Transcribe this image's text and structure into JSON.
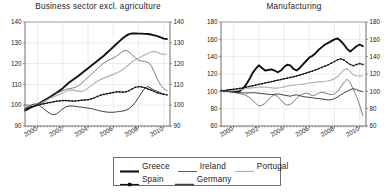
{
  "figure": {
    "panels": [
      {
        "title": "Business sector excl. agriculture"
      },
      {
        "title": "Manufacturing"
      }
    ]
  },
  "legend": {
    "rows": [
      [
        {
          "label": "Greece",
          "swatch": "solid-thick-line-swatch"
        },
        {
          "label": "Ireland",
          "swatch": "solid-thin-line-swatch"
        },
        {
          "label": "Portugal",
          "swatch": "solid-light-line-swatch"
        }
      ],
      [
        {
          "label": "Spain",
          "swatch": "marked-line-swatch"
        },
        {
          "label": "Germany",
          "swatch": "solid-medium-line-swatch"
        }
      ]
    ]
  },
  "colors": {
    "greece": "#111111",
    "ireland": "#5c5c5c",
    "portugal": "#b4b4b4",
    "spain": "#111111",
    "germany": "#3f3f3f",
    "axis": "#6e6e6e",
    "grid": "#d8d8d8",
    "background": "#ffffff"
  },
  "chart_data": [
    {
      "type": "line",
      "title": "Business sector excl. agriculture",
      "xlabel": "",
      "ylabel": "",
      "xlim": [
        1999.0,
        2010.5
      ],
      "ylim": [
        90,
        140
      ],
      "grid": true,
      "legend_position": "below-figure",
      "xticks": [
        2000,
        2002,
        2004,
        2006,
        2008,
        2010
      ],
      "xtick_labels": [
        "2000",
        "2002",
        "2004",
        "2006",
        "2008",
        "2010"
      ],
      "yticks": [
        90,
        100,
        110,
        120,
        130,
        140
      ],
      "ytick_labels": [
        "90",
        "100",
        "110",
        "120",
        "130",
        "140"
      ],
      "y_axis_mirrored": true,
      "x": [
        1999.0,
        1999.25,
        1999.5,
        1999.75,
        2000.0,
        2000.25,
        2000.5,
        2000.75,
        2001.0,
        2001.25,
        2001.5,
        2001.75,
        2002.0,
        2002.25,
        2002.5,
        2002.75,
        2003.0,
        2003.25,
        2003.5,
        2003.75,
        2004.0,
        2004.25,
        2004.5,
        2004.75,
        2005.0,
        2005.25,
        2005.5,
        2005.75,
        2006.0,
        2006.25,
        2006.5,
        2006.75,
        2007.0,
        2007.25,
        2007.5,
        2007.75,
        2008.0,
        2008.25,
        2008.5,
        2008.75,
        2009.0,
        2009.25,
        2009.5,
        2009.75,
        2010.0,
        2010.25
      ],
      "series": [
        {
          "name": "Greece",
          "values": [
            97.4,
            98.2,
            99.0,
            99.7,
            100.4,
            101.3,
            102.2,
            103.1,
            104.0,
            105.0,
            106.0,
            107.0,
            108.2,
            109.6,
            110.9,
            112.0,
            113.1,
            114.2,
            115.4,
            116.6,
            117.8,
            119.0,
            120.2,
            121.4,
            122.6,
            123.8,
            125.2,
            126.6,
            128.0,
            129.4,
            130.8,
            132.2,
            133.3,
            134.2,
            134.5,
            134.5,
            134.4,
            134.4,
            134.3,
            134.2,
            134.0,
            133.6,
            133.2,
            132.6,
            132.0,
            131.8
          ]
        },
        {
          "name": "Ireland",
          "values": [
            100.2,
            100.0,
            99.8,
            99.6,
            99.8,
            100.3,
            101.2,
            102.4,
            103.6,
            104.6,
            105.6,
            106.4,
            107.0,
            107.6,
            107.9,
            108.2,
            108.6,
            109.4,
            110.6,
            112.0,
            113.4,
            114.8,
            116.2,
            117.6,
            119.0,
            120.2,
            121.2,
            122.0,
            122.6,
            123.6,
            124.8,
            125.8,
            126.4,
            125.6,
            124.2,
            122.8,
            121.6,
            121.2,
            121.0,
            120.6,
            119.2,
            116.0,
            112.4,
            109.8,
            108.0,
            107.0
          ]
        },
        {
          "name": "Portugal",
          "values": [
            100.0,
            99.9,
            99.8,
            99.9,
            100.2,
            100.8,
            101.6,
            102.5,
            103.3,
            104.0,
            104.6,
            105.2,
            105.9,
            106.6,
            107.2,
            107.4,
            107.0,
            106.6,
            106.6,
            107.2,
            108.2,
            109.4,
            110.6,
            111.6,
            112.4,
            113.0,
            113.6,
            114.2,
            114.8,
            115.4,
            116.2,
            117.2,
            118.4,
            119.6,
            120.8,
            121.8,
            122.6,
            123.4,
            124.2,
            125.0,
            125.6,
            125.8,
            125.4,
            124.8,
            124.4,
            124.6
          ]
        },
        {
          "name": "Spain",
          "values": [
            98.0,
            98.6,
            99.2,
            99.6,
            100.0,
            100.4,
            100.7,
            101.0,
            101.3,
            101.6,
            101.9,
            102.1,
            102.2,
            102.2,
            102.1,
            102.0,
            102.0,
            102.2,
            102.4,
            102.5,
            102.6,
            103.0,
            103.6,
            104.2,
            104.8,
            105.2,
            105.5,
            105.8,
            106.1,
            106.4,
            106.4,
            106.3,
            106.4,
            107.0,
            107.8,
            108.6,
            108.9,
            108.8,
            108.4,
            107.8,
            107.2,
            106.6,
            106.0,
            105.6,
            105.2,
            105.0
          ]
        },
        {
          "name": "Germany",
          "values": [
            98.6,
            99.4,
            100.1,
            100.6,
            100.4,
            99.4,
            98.2,
            97.0,
            96.0,
            95.4,
            95.8,
            97.0,
            98.3,
            99.2,
            99.6,
            99.6,
            99.4,
            99.2,
            99.0,
            98.8,
            98.6,
            98.4,
            98.0,
            97.6,
            97.2,
            96.9,
            96.7,
            96.6,
            96.6,
            96.8,
            97.0,
            97.2,
            97.6,
            98.4,
            99.6,
            101.4,
            103.6,
            106.0,
            108.2,
            109.0,
            108.0,
            107.2,
            106.6,
            106.0,
            105.4,
            105.0
          ]
        }
      ]
    },
    {
      "type": "line",
      "title": "Manufacturing",
      "xlabel": "",
      "ylabel": "",
      "xlim": [
        1999.0,
        2010.5
      ],
      "ylim": [
        60,
        180
      ],
      "grid": true,
      "legend_position": "below-figure",
      "xticks": [
        2000,
        2002,
        2004,
        2006,
        2008,
        2010
      ],
      "xtick_labels": [
        "2000",
        "2002",
        "2004",
        "2006",
        "2008",
        "2010"
      ],
      "yticks": [
        60,
        80,
        100,
        120,
        140,
        160,
        180
      ],
      "ytick_labels": [
        "60",
        "80",
        "100",
        "120",
        "140",
        "160",
        "180"
      ],
      "y_axis_mirrored": true,
      "x": [
        1999.0,
        1999.25,
        1999.5,
        1999.75,
        2000.0,
        2000.25,
        2000.5,
        2000.75,
        2001.0,
        2001.25,
        2001.5,
        2001.75,
        2002.0,
        2002.25,
        2002.5,
        2002.75,
        2003.0,
        2003.25,
        2003.5,
        2003.75,
        2004.0,
        2004.25,
        2004.5,
        2004.75,
        2005.0,
        2005.25,
        2005.5,
        2005.75,
        2006.0,
        2006.25,
        2006.5,
        2006.75,
        2007.0,
        2007.25,
        2007.5,
        2007.75,
        2008.0,
        2008.25,
        2008.5,
        2008.75,
        2009.0,
        2009.25,
        2009.5,
        2009.75,
        2010.0,
        2010.25
      ],
      "series": [
        {
          "name": "Greece",
          "values": [
            101.0,
            100.0,
            100.6,
            101.4,
            100.2,
            99.0,
            100.6,
            103.4,
            108.0,
            114.0,
            121.0,
            126.0,
            130.0,
            127.0,
            124.0,
            124.6,
            125.4,
            124.0,
            122.0,
            124.0,
            128.0,
            130.6,
            130.0,
            126.0,
            124.0,
            127.0,
            131.0,
            135.0,
            139.0,
            141.0,
            144.0,
            148.0,
            151.0,
            154.0,
            156.0,
            158.0,
            160.0,
            161.0,
            158.0,
            154.0,
            149.0,
            146.0,
            149.0,
            152.0,
            154.0,
            152.0
          ]
        },
        {
          "name": "Ireland",
          "values": [
            100.6,
            100.2,
            99.6,
            99.0,
            98.6,
            98.0,
            97.4,
            96.4,
            95.0,
            93.0,
            90.0,
            86.0,
            83.0,
            84.0,
            86.0,
            90.0,
            94.0,
            96.0,
            94.0,
            90.0,
            86.0,
            84.0,
            85.0,
            88.0,
            92.0,
            95.0,
            97.0,
            98.0,
            97.0,
            95.0,
            96.0,
            98.0,
            99.0,
            98.0,
            97.0,
            96.0,
            97.0,
            100.0,
            105.0,
            110.0,
            114.0,
            110.0,
            102.0,
            94.0,
            84.0,
            72.0,
            67.0
          ]
        },
        {
          "name": "Portugal",
          "values": [
            100.2,
            100.4,
            100.8,
            101.0,
            101.2,
            101.4,
            101.8,
            102.4,
            103.0,
            103.6,
            104.0,
            104.4,
            104.8,
            105.0,
            104.8,
            104.4,
            104.0,
            103.6,
            103.8,
            104.4,
            105.2,
            106.0,
            106.8,
            107.2,
            107.6,
            108.0,
            108.4,
            109.0,
            109.6,
            110.0,
            110.4,
            110.8,
            111.2,
            111.6,
            112.2,
            113.0,
            114.4,
            117.0,
            121.0,
            125.0,
            126.0,
            123.0,
            119.0,
            118.0,
            117.6,
            118.0
          ]
        },
        {
          "name": "Spain",
          "values": [
            100.4,
            100.8,
            101.4,
            102.0,
            102.4,
            102.8,
            103.4,
            104.0,
            104.8,
            105.6,
            106.4,
            107.2,
            108.0,
            108.8,
            109.6,
            110.4,
            111.2,
            112.0,
            112.8,
            113.6,
            114.4,
            115.2,
            116.0,
            116.8,
            117.8,
            118.8,
            119.8,
            121.0,
            122.2,
            123.4,
            124.8,
            126.2,
            127.6,
            129.0,
            130.6,
            132.4,
            134.4,
            136.4,
            137.6,
            136.0,
            133.4,
            131.0,
            129.6,
            131.0,
            132.0,
            131.0
          ]
        },
        {
          "name": "Germany",
          "values": [
            100.6,
            100.4,
            100.0,
            99.6,
            99.2,
            98.8,
            98.4,
            98.2,
            98.0,
            98.2,
            98.4,
            98.2,
            97.8,
            97.4,
            97.0,
            96.6,
            96.2,
            96.6,
            97.0,
            96.4,
            95.6,
            95.0,
            94.4,
            95.4,
            96.0,
            95.0,
            94.0,
            93.4,
            93.0,
            92.6,
            92.0,
            91.6,
            91.2,
            90.6,
            90.0,
            90.4,
            91.6,
            93.6,
            96.0,
            98.0,
            100.0,
            102.0,
            103.0,
            102.0,
            100.4,
            99.6
          ]
        }
      ]
    }
  ]
}
